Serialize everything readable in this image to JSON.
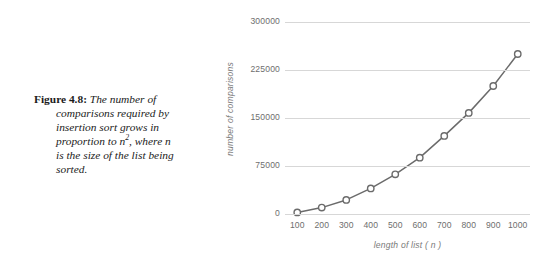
{
  "caption": {
    "label": "Figure 4.8:",
    "line1": "The number of",
    "line2": "comparisons required by",
    "line3": "insertion sort grows in",
    "line4_pre": "proportion to ",
    "line4_var": "n",
    "line4_exp": "2",
    "line4_post": ", where ",
    "line4_var2": "n",
    "line5": "is the size of the list being",
    "line6": "sorted."
  },
  "chart_data": {
    "type": "line",
    "title": "",
    "xlabel": "length of list ( n )",
    "ylabel": "number of comparisons",
    "x": [
      100,
      200,
      300,
      400,
      500,
      600,
      700,
      800,
      900,
      1000
    ],
    "xtick_labels": [
      "100",
      "200",
      "300",
      "400",
      "500",
      "600",
      "700",
      "800",
      "900",
      "1000"
    ],
    "values": [
      2500,
      10000,
      22000,
      40000,
      62000,
      88000,
      122000,
      158000,
      200000,
      250000
    ],
    "series": [
      {
        "name": "number of comparisons",
        "values": [
          2500,
          10000,
          22000,
          40000,
          62000,
          88000,
          122000,
          158000,
          200000,
          250000
        ]
      }
    ],
    "ytick_labels": [
      "0",
      "75000",
      "150000",
      "225000",
      "300000"
    ],
    "yticks": [
      0,
      75000,
      150000,
      225000,
      300000
    ],
    "ylim": [
      0,
      300000
    ],
    "xlim": [
      50,
      1050
    ],
    "grid": true,
    "grid_axis": "y",
    "legend": "none",
    "line_color": "#6b6b6b",
    "marker": "open-circle",
    "marker_fill": "#ffffff",
    "grid_color": "#d7d7d7",
    "tick_color": "#6e6e6e"
  }
}
